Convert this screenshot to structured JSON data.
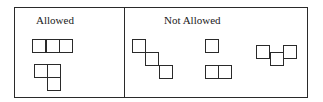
{
  "diagram": {
    "frame": {
      "x": 14,
      "y": 7,
      "w": 294,
      "h": 91
    },
    "divider_x": 124,
    "stroke_color": "#2a2a2a",
    "panels": [
      {
        "id": "allowed",
        "label": "Allowed",
        "label_pos": {
          "x": 36,
          "y": 15
        },
        "shapes": [
          {
            "name": "straight-tromino",
            "cells": [
              [
                32,
                39
              ],
              [
                46,
                39
              ],
              [
                59,
                39
              ]
            ]
          },
          {
            "name": "l-tromino",
            "cells": [
              [
                34,
                64
              ],
              [
                47,
                64
              ],
              [
                47,
                77
              ]
            ]
          }
        ]
      },
      {
        "id": "not-allowed",
        "label": "Not Allowed",
        "label_pos": {
          "x": 164,
          "y": 15
        },
        "shapes": [
          {
            "name": "diagonal-tromino",
            "cells": [
              [
                132,
                39
              ],
              [
                145,
                52
              ],
              [
                159,
                65
              ]
            ]
          },
          {
            "name": "monomino",
            "cells": [
              [
                205,
                39
              ]
            ]
          },
          {
            "name": "domino",
            "cells": [
              [
                205,
                65
              ],
              [
                218,
                65
              ]
            ]
          },
          {
            "name": "offset-tromino",
            "cells": [
              [
                256,
                45
              ],
              [
                270,
                52
              ],
              [
                283,
                45
              ]
            ]
          }
        ]
      }
    ],
    "cell_size": 14
  }
}
